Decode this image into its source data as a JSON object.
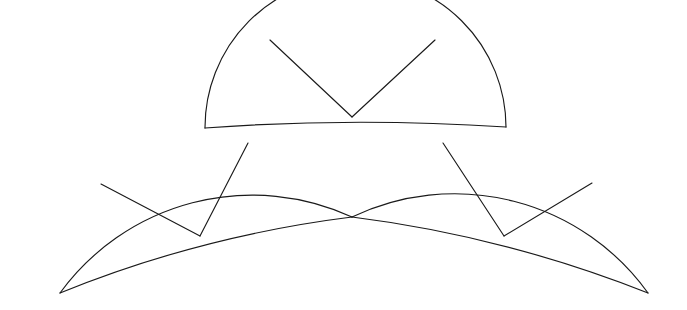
{
  "figure": {
    "canvas": {
      "width": 687,
      "height": 310
    },
    "background_color": "#ffffff",
    "stroke_color": "#1a1a1a",
    "stroke_width": 1.15,
    "fill": "none",
    "shape_count": 3,
    "sectors_per_shape": 3
  },
  "chart_data": {
    "type": "diagram",
    "shapes": [
      {
        "name": "top-fan",
        "role": "upper small sector",
        "center": {
          "x": 352,
          "y": 117
        },
        "inner_radius": 0,
        "outer_radius": 103,
        "start_angle_deg": 180,
        "end_angle_deg": 360,
        "sweep_deg": 180,
        "subdivisions": 3,
        "radial_angles_deg": [
          240,
          300
        ],
        "apex": {
          "x": 352,
          "y": 117
        },
        "arc_top": {
          "x": 353,
          "y": 14
        },
        "left_foot": {
          "x": 205,
          "y": 128
        },
        "right_foot": {
          "x": 506,
          "y": 127
        },
        "radial_tip_left": {
          "x": 270,
          "y": 40
        },
        "radial_tip_right": {
          "x": 435,
          "y": 40
        }
      },
      {
        "name": "left-fan",
        "role": "lower-left large sector",
        "center": {
          "x": 200,
          "y": 236
        },
        "inner_radius": 0,
        "outer_radius": 156,
        "start_angle_deg": 180,
        "end_angle_deg": 310,
        "sweep_deg": 130,
        "subdivisions": 3,
        "radial_angles_deg": [
          223,
          267
        ],
        "apex": {
          "x": 200,
          "y": 236
        },
        "left_foot": {
          "x": 60,
          "y": 293
        },
        "right_foot": {
          "x": 352,
          "y": 217
        },
        "radial_tip_left": {
          "x": 101,
          "y": 184
        },
        "radial_tip_right": {
          "x": 248,
          "y": 143
        }
      },
      {
        "name": "right-fan",
        "role": "lower-right large sector",
        "center": {
          "x": 504,
          "y": 236
        },
        "inner_radius": 0,
        "outer_radius": 156,
        "start_angle_deg": 230,
        "end_angle_deg": 360,
        "sweep_deg": 130,
        "subdivisions": 3,
        "radial_angles_deg": [
          273,
          317
        ],
        "apex": {
          "x": 504,
          "y": 236
        },
        "left_foot": {
          "x": 352,
          "y": 217
        },
        "right_foot": {
          "x": 648,
          "y": 293
        },
        "radial_tip_left": {
          "x": 443,
          "y": 143
        },
        "radial_tip_right": {
          "x": 592,
          "y": 183
        }
      }
    ],
    "paths": {
      "top_outer_arc": "M 205 128 A 150 150 0 0 1 506 127",
      "top_inner_arc": "M 205 128 Q 352 117 506 127",
      "top_radial_left": "M 352 117 L 270 40",
      "top_radial_right": "M 352 117 L 435 40",
      "left_outer_arc": "M 60 293 A 238 238 0 0 1 352 217",
      "left_inner_chord": "M 60 293 Q 200 236 352 217",
      "left_radial_outer": "M 200 236 L 101 184",
      "left_radial_inner": "M 200 236 L 248 143",
      "right_outer_arc": "M 352 217 A 238 238 0 0 1 648 293",
      "right_inner_chord": "M 352 217 Q 504 236 648 293",
      "right_radial_inner": "M 504 236 L 443 143",
      "right_radial_outer": "M 504 236 L 592 183"
    },
    "grid": false,
    "legend": null,
    "axis_labels": null,
    "annotations": []
  }
}
